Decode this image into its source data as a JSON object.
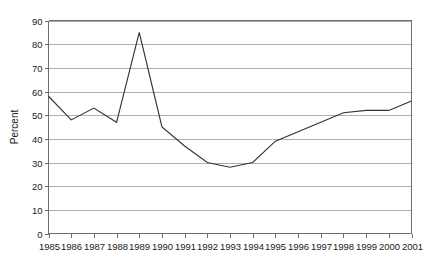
{
  "chart_data": {
    "type": "line",
    "title": "",
    "subtitle": "",
    "xlabel": "",
    "ylabel": "Percent",
    "x": [
      1985,
      1986,
      1987,
      1988,
      1989,
      1990,
      1991,
      1992,
      1993,
      1994,
      1995,
      1996,
      1997,
      1998,
      1999,
      2000,
      2001
    ],
    "categories": [
      "1985",
      "1986",
      "1987",
      "1988",
      "1989",
      "1990",
      "1991",
      "1992",
      "1993",
      "1994",
      "1995",
      "1996",
      "1997",
      "1998",
      "1999",
      "2000",
      "2001"
    ],
    "values": [
      58,
      48,
      53,
      47,
      85,
      45,
      37,
      30,
      28,
      30,
      39,
      43,
      47,
      51,
      52,
      52,
      56
    ],
    "series": [
      {
        "name": "Percent",
        "values": [
          58,
          48,
          53,
          47,
          85,
          45,
          37,
          30,
          28,
          30,
          39,
          43,
          47,
          51,
          52,
          52,
          56
        ]
      }
    ],
    "ylim": [
      0,
      90
    ],
    "xlim": [
      1985,
      2001
    ],
    "yticks": [
      0,
      10,
      20,
      30,
      40,
      50,
      60,
      70,
      80,
      90
    ],
    "ytick_labels": [
      "0",
      "10",
      "20",
      "30",
      "40",
      "50",
      "60",
      "70",
      "80",
      "90"
    ],
    "xtick_labels": [
      "1985",
      "1986",
      "1987",
      "1988",
      "1989",
      "1990",
      "1991",
      "1992",
      "1993",
      "1994",
      "1995",
      "1996",
      "1997",
      "1998",
      "1999",
      "2000",
      "2001"
    ],
    "grid": true,
    "grid_axis": "y",
    "legend": false,
    "legend_position": "none",
    "markers": false,
    "annotations": [],
    "colors": {
      "line": "#333333",
      "grid": "#9a9a9a",
      "frame": "#6e6e6e",
      "background": "#ffffff",
      "text": "#1a1a1a"
    }
  }
}
